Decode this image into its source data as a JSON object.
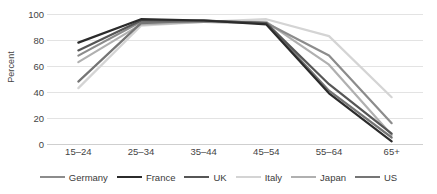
{
  "chart_data": {
    "type": "line",
    "title": "",
    "xlabel": "",
    "ylabel": "Percent",
    "categories": [
      "15–24",
      "25–34",
      "35–44",
      "45–54",
      "55–64",
      "65+"
    ],
    "ylim": [
      0,
      100
    ],
    "yticks": [
      0,
      20,
      40,
      60,
      80,
      100
    ],
    "grid": true,
    "legend_position": "bottom",
    "series": [
      {
        "name": "Germany",
        "color": "#8c8c8c",
        "values": [
          68,
          94,
          94,
          93,
          68,
          16
        ]
      },
      {
        "name": "France",
        "color": "#2b2b2b",
        "values": [
          78,
          96,
          95,
          92,
          39,
          2
        ]
      },
      {
        "name": "UK",
        "color": "#565656",
        "values": [
          72,
          95,
          95,
          93,
          46,
          8
        ]
      },
      {
        "name": "Italy",
        "color": "#d4d4d4",
        "values": [
          43,
          91,
          94,
          96,
          83,
          36
        ]
      },
      {
        "name": "Japan",
        "color": "#b0b0b0",
        "values": [
          63,
          92,
          94,
          94,
          61,
          7
        ]
      },
      {
        "name": "US",
        "color": "#757575",
        "values": [
          48,
          93,
          95,
          93,
          41,
          5
        ]
      }
    ]
  },
  "yticks": {
    "t0": "0",
    "t20": "20",
    "t40": "40",
    "t60": "60",
    "t80": "80",
    "t100": "100"
  },
  "xticks": {
    "x0": "15–24",
    "x1": "25–34",
    "x2": "35–44",
    "x3": "45–54",
    "x4": "55–64",
    "x5": "65+"
  },
  "axis": {
    "y_title": "Percent"
  },
  "legend": {
    "items": [
      {
        "label": "Germany"
      },
      {
        "label": "France"
      },
      {
        "label": "UK"
      },
      {
        "label": "Italy"
      },
      {
        "label": "Japan"
      },
      {
        "label": "US"
      }
    ]
  }
}
